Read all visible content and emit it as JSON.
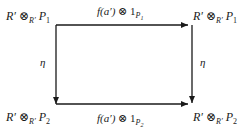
{
  "diagram": {
    "type": "commutative-square",
    "nodes": {
      "top_left": {
        "base": "R′",
        "op": "⊗",
        "sub": "R′",
        "obj": "P",
        "obj_sub": "1"
      },
      "top_right": {
        "base": "R′",
        "op": "⊗",
        "sub": "R′",
        "obj": "P",
        "obj_sub": "1"
      },
      "bottom_left": {
        "base": "R′",
        "op": "⊗",
        "sub": "R′",
        "obj": "P",
        "obj_sub": "2"
      },
      "bottom_right": {
        "base": "R′",
        "op": "⊗",
        "sub": "R′",
        "obj": "P",
        "obj_sub": "2"
      }
    },
    "edges": {
      "top": {
        "fn": "f(a′)",
        "op": "⊗",
        "id": "1",
        "id_sub": "P",
        "id_sub_sub": "1",
        "from": "top_left",
        "to": "top_right"
      },
      "bottom": {
        "fn": "f(a′)",
        "op": "⊗",
        "id": "1",
        "id_sub": "P",
        "id_sub_sub": "2",
        "from": "bottom_left",
        "to": "bottom_right"
      },
      "left": {
        "label": "η",
        "from": "top_left",
        "to": "bottom_left"
      },
      "right": {
        "label": "η",
        "from": "top_right",
        "to": "bottom_right"
      }
    },
    "colors": {
      "ink": "#1a1a1a",
      "background": "#ffffff"
    }
  }
}
